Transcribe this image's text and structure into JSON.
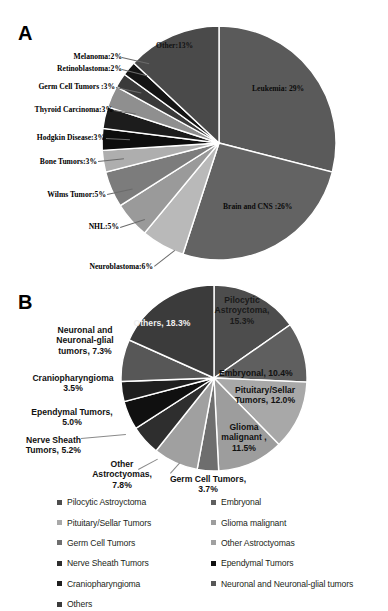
{
  "figure": {
    "panel_a_letter": "A",
    "panel_b_letter": "B"
  },
  "chart_data": [
    {
      "type": "pie",
      "panel": "A",
      "title": "",
      "start_angle_deg": 0,
      "direction": "clockwise",
      "categories": [
        "Leukemia",
        "Brain and CNS",
        "Neuroblastoma",
        "NHL",
        "Wilms Tumor",
        "Bone Tumors",
        "Hodgkin Disease",
        "Thyroid Carcinoma",
        "Germ Cell Tumors",
        "Retinoblastoma",
        "Melanoma",
        "Other"
      ],
      "values": [
        29,
        26,
        6,
        5,
        5,
        3,
        3,
        3,
        3,
        2,
        2,
        13
      ],
      "value_unit": "%",
      "labels": [
        "Leukemia: 29%",
        "Brain  and CNS :26%",
        "Neuroblastoma:6%",
        "NHL:5%",
        "Wilms Tumor:5%",
        "Bone Tumors:3%",
        "Hodgkin Disease:3%",
        "Thyroid Carcinoma:3%",
        "Germ Cell Tumors :3%",
        "Retinoblastoma:2%",
        "Melanoma:2%",
        "Other:13%"
      ],
      "colors": [
        "#5a5a5a",
        "#636363",
        "#b9b9b9",
        "#9a9a9a",
        "#7c7c7c",
        "#aeaeae",
        "#0d0d0d",
        "#1c1c1c",
        "#8f8f8f",
        "#3a3a3a",
        "#141414",
        "#4a4a4a"
      ],
      "legend": "none",
      "grid": false
    },
    {
      "type": "pie",
      "panel": "B",
      "title": "",
      "start_angle_deg": 0,
      "direction": "clockwise",
      "categories": [
        "Pilocytic Astroyctoma",
        "Embryonal",
        "Pituitary/Sellar Tumors",
        "Glioma malignant",
        "Germ Cell Tumors",
        "Other Astroctyomas",
        "Nerve Sheath Tumors",
        "Ependymal Tumors",
        "Craniopharyngioma",
        "Neuronal and Neuronal-glial tumors",
        "Others"
      ],
      "values": [
        15.3,
        10.4,
        12.0,
        11.5,
        3.7,
        7.8,
        5.2,
        5.0,
        3.5,
        7.3,
        18.3
      ],
      "value_unit": "%",
      "labels": [
        "Pilocytic\nAstroyctoma,\n15.3%",
        "Embryonal, 10.4%",
        "Pituitary/Sellar\nTumors, 12.0%",
        "Glioma\nmalignant ,\n11.5%",
        "Germ Cell Tumors,\n3.7%",
        "Other\nAstroctyomas,\n7.8%",
        "Nerve Sheath\nTumors, 5.2%",
        "Ependymal Tumors,\n5.0%",
        "Craniopharyngioma\n3.5%",
        "Neuronal and\nNeuronal-glial\ntumors, 7.3%",
        "Others, 18.3%"
      ],
      "colors": [
        "#4d4d4d",
        "#5f5f5f",
        "#a8a8a8",
        "#9d9d9d",
        "#6e6e6e",
        "#a0a0a0",
        "#2e2e2e",
        "#101010",
        "#1f1f1f",
        "#575757",
        "#3b3b3b"
      ],
      "legend": "bottom",
      "grid": false
    }
  ],
  "legend": {
    "column_1": [
      {
        "label": "Pilocytic Astroyctoma",
        "color": "#4d4d4d"
      },
      {
        "label": "Pituitary/Sellar Tumors",
        "color": "#a8a8a8"
      },
      {
        "label": "Germ Cell Tumors",
        "color": "#6e6e6e"
      },
      {
        "label": "Nerve Sheath Tumors",
        "color": "#2e2e2e"
      },
      {
        "label": "Craniopharyngioma",
        "color": "#1f1f1f"
      },
      {
        "label": "Others",
        "color": "#3b3b3b"
      }
    ],
    "column_2": [
      {
        "label": "Embryonal",
        "color": "#5f5f5f"
      },
      {
        "label": "Glioma malignant",
        "color": "#9d9d9d"
      },
      {
        "label": "Other Astroctyomas",
        "color": "#a0a0a0"
      },
      {
        "label": "Ependymal Tumors",
        "color": "#101010"
      },
      {
        "label": "Neuronal and Neuronal-glial tumors",
        "color": "#575757"
      }
    ]
  }
}
